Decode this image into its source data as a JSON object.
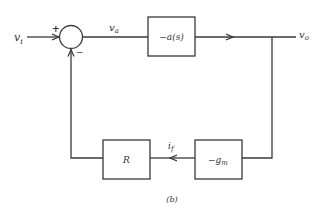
{
  "diagram": {
    "type": "block-diagram",
    "caption": "(b)",
    "signals": {
      "input": "v",
      "input_sub": "i",
      "error": "v",
      "error_sub": "a",
      "output": "v",
      "output_sub": "o",
      "feedback_current": "i",
      "feedback_current_sub": "f"
    },
    "summing_junction": {
      "plus_sign": "+",
      "minus_sign": "−"
    },
    "blocks": [
      {
        "id": "forward",
        "label": "−a(s)"
      },
      {
        "id": "transconductance",
        "label": "−g",
        "label_sub": "m"
      },
      {
        "id": "resistor",
        "label": "R"
      }
    ],
    "colors": {
      "stroke": "#3a3a3a",
      "text": "#333333",
      "background": "#ffffff"
    }
  }
}
